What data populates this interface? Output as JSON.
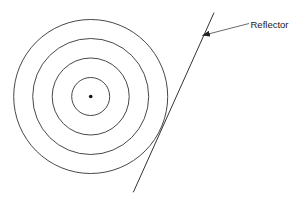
{
  "diagram": {
    "type": "wavefront-reflector",
    "source": {
      "cx": 90.7,
      "cy": 96.5,
      "r": 1.8
    },
    "wavefronts": [
      {
        "r": 19
      },
      {
        "r": 38.5
      },
      {
        "r": 58
      },
      {
        "r": 77
      }
    ],
    "reflector_line": {
      "x1": 214,
      "y1": 12.7,
      "x2": 133.3,
      "y2": 192.3
    },
    "label": {
      "text": "Reflector",
      "x": 250.5,
      "y": 27.5
    },
    "arrow": {
      "x1": 249,
      "y1": 23.5,
      "x2": 202.5,
      "y2": 35.5
    },
    "colors": {
      "stroke": "#333333",
      "background": "#ffffff"
    }
  }
}
